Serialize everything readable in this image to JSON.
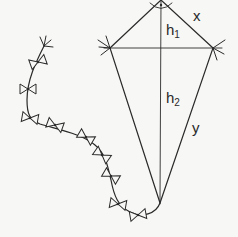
{
  "diagram": {
    "stroke_color": "#2a2a2a",
    "background": "#f7f7f5",
    "kite": {
      "top": [
        161,
        0
      ],
      "left": [
        110,
        48
      ],
      "right": [
        213,
        48
      ],
      "bottom": [
        160,
        203
      ]
    },
    "labels": {
      "x": {
        "text": "x",
        "pos": [
          193,
          10
        ]
      },
      "h1": {
        "base": "h",
        "sub": "1",
        "pos": [
          166,
          23
        ]
      },
      "h2": {
        "base": "h",
        "sub": "2",
        "pos": [
          166,
          91
        ]
      },
      "y": {
        "base": "y",
        "pos": [
          192,
          122
        ]
      }
    },
    "right_angle_marker": "•",
    "tail_bows": [
      [
        38,
        62
      ],
      [
        28,
        89
      ],
      [
        30,
        118
      ],
      [
        55,
        125
      ],
      [
        86,
        137
      ],
      [
        102,
        155
      ],
      [
        111,
        176
      ],
      [
        118,
        204
      ],
      [
        138,
        215
      ]
    ]
  }
}
